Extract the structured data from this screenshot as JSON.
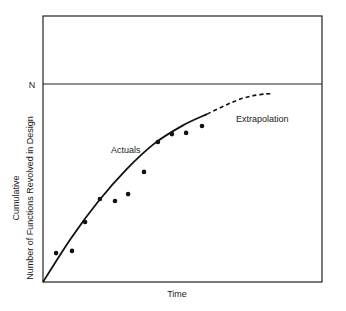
{
  "chart_data": {
    "type": "line",
    "title": "",
    "xlabel": "Time",
    "ylabel": [
      "Cumulative",
      "Number of Functions Revolved in Design"
    ],
    "y_reference": {
      "label": "N",
      "value": 1.0
    },
    "xlim": [
      0,
      10
    ],
    "ylim": [
      0,
      1.345
    ],
    "grid": false,
    "legend": "none",
    "annotations": [
      {
        "text": "Actuals",
        "x": 2.45,
        "y": 0.66
      },
      {
        "text": "Extrapolation",
        "x": 6.9,
        "y": 0.82
      }
    ],
    "series": [
      {
        "name": "Actuals (data points)",
        "style": "scatter",
        "x": [
          0.47,
          1.04,
          1.51,
          2.04,
          2.58,
          3.05,
          3.62,
          4.12,
          4.62,
          5.13,
          5.7
        ],
        "y": [
          0.146,
          0.157,
          0.303,
          0.419,
          0.409,
          0.444,
          0.556,
          0.707,
          0.747,
          0.753,
          0.788
        ]
      },
      {
        "name": "Actuals (fitted curve)",
        "style": "solid",
        "x": [
          0.0,
          1.0,
          2.0,
          3.0,
          4.0,
          5.0,
          5.88
        ],
        "y": [
          0.0,
          0.22,
          0.41,
          0.57,
          0.7,
          0.79,
          0.848
        ]
      },
      {
        "name": "Extrapolation",
        "style": "dashed",
        "x": [
          5.88,
          6.5,
          7.0,
          7.5,
          8.0,
          8.25
        ],
        "y": [
          0.848,
          0.89,
          0.92,
          0.94,
          0.95,
          0.95
        ]
      }
    ]
  },
  "labels": {
    "n_marker": "N",
    "x_axis": "Time",
    "y_axis_line1": "Cumulative",
    "y_axis_line2": "Number of Functions Revolved in Design",
    "actuals": "Actuals",
    "extrapolation": "Extrapolation"
  }
}
